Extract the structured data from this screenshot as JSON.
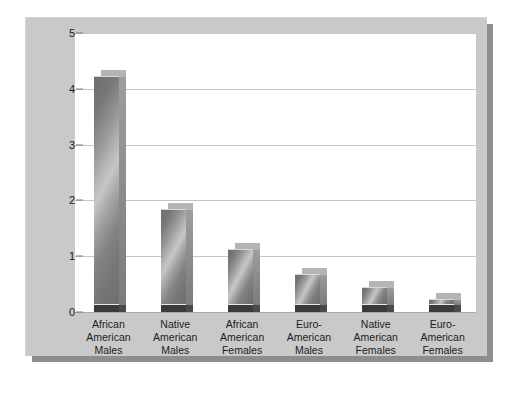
{
  "chart_data": {
    "type": "bar",
    "title": "",
    "xlabel": "",
    "ylabel": "Number of Homicides Per 100 Persons",
    "ylim": [
      0,
      5
    ],
    "yticks": [
      0,
      1,
      2,
      3,
      4,
      5
    ],
    "ytick_labels": [
      "0",
      "1",
      "2",
      "3",
      "4",
      "5"
    ],
    "grid": true,
    "legend": "none",
    "categories": [
      "African American Males",
      "Native American Males",
      "African American Females",
      "Euro-American Males",
      "Native American Females",
      "Euro-American Females"
    ],
    "category_lines": [
      [
        "African",
        "American",
        "Males"
      ],
      [
        "Native",
        "American",
        "Males"
      ],
      [
        "African",
        "American",
        "Females"
      ],
      [
        "Euro-",
        "American",
        "Males"
      ],
      [
        "Native",
        "American",
        "Females"
      ],
      [
        "Euro-",
        "American",
        "Females"
      ]
    ],
    "values": [
      4.1,
      1.72,
      1.0,
      0.55,
      0.33,
      0.1
    ],
    "bar_style": "3d-gray-gradient",
    "colors": {
      "bar_light": "#c6c6c6",
      "bar_dark": "#6e6e6e",
      "bar_base": "#3a3a3a",
      "panel_background": "#c9c9c9",
      "plot_background": "#ffffff",
      "gridline": "#c5c5c5",
      "axis_text": "#1c1c1c",
      "drop_shadow": "#8d8d8d"
    }
  }
}
